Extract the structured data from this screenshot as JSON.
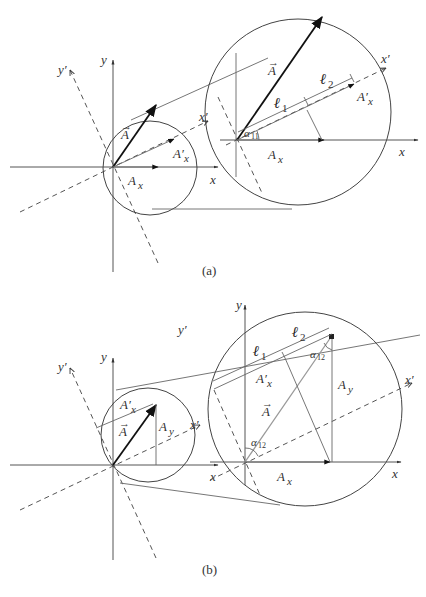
{
  "figure_a": {
    "caption": "(a)",
    "small": {
      "axis_x": "x",
      "axis_y": "y",
      "axis_xp": "x′",
      "axis_yp": "y′",
      "vec_A": "A",
      "vec_Axp": "A′",
      "vec_Axp_sub": "x",
      "vec_Ax": "A",
      "vec_Ax_sub": "x"
    },
    "large": {
      "axis_x": "x",
      "axis_xp": "x′",
      "vec_A": "A",
      "vec_Axp": "A′",
      "vec_Axp_sub": "x",
      "vec_Ax": "A",
      "vec_Ax_sub": "x",
      "l1": "ℓ",
      "l1_sub": "1",
      "l2": "ℓ",
      "l2_sub": "2",
      "angle": "α",
      "angle_sub": "11"
    }
  },
  "figure_b": {
    "caption": "(b)",
    "small": {
      "axis_x": "x",
      "axis_y": "y",
      "axis_xp": "x′",
      "axis_yp": "y′",
      "vec_A": "A",
      "vec_Axp": "A′",
      "vec_Axp_sub": "x",
      "vec_Ay": "A",
      "vec_Ay_sub": "y"
    },
    "large": {
      "axis_x": "x",
      "axis_y": "y",
      "axis_xp": "x′",
      "axis_yp": "y′",
      "vec_A": "A",
      "vec_Axp": "A′",
      "vec_Axp_sub": "x",
      "vec_Ax": "A",
      "vec_Ax_sub": "x",
      "vec_Ay": "A",
      "vec_Ay_sub": "y",
      "l1": "ℓ",
      "l1_sub": "1",
      "l2": "ℓ",
      "l2_sub": "2",
      "angle_top": "α",
      "angle_top_sub": "12",
      "angle_bottom": "α",
      "angle_bottom_sub": "12"
    }
  }
}
